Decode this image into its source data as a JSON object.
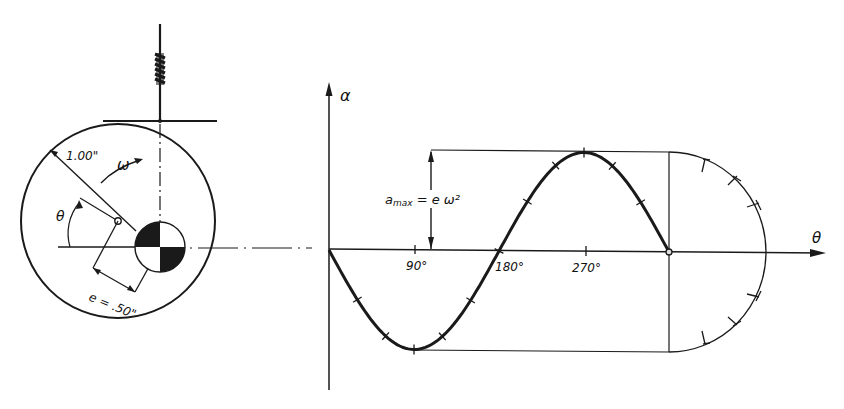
{
  "colors": {
    "ink": "#1a1a1a",
    "background": "#ffffff"
  },
  "cam_figure": {
    "radius_label": "1.00\"",
    "omega_label": "ω",
    "theta_label": "θ",
    "eccentricity_label": "e = .50\""
  },
  "graph": {
    "y_axis_label": "α",
    "x_axis_label": "θ",
    "amax_label": "a",
    "amax_sub": "max",
    "amax_eq": " = e ω²",
    "ticks": [
      "90°",
      "180°",
      "270°"
    ]
  },
  "chart_data": {
    "type": "line",
    "title": "",
    "xlabel": "θ",
    "ylabel": "α",
    "x": [
      0,
      30,
      60,
      90,
      120,
      150,
      180,
      210,
      240,
      270,
      300,
      330,
      360
    ],
    "series": [
      {
        "name": "α (normalized to a_max = e ω²)",
        "values": [
          0,
          -0.5,
          -0.866,
          -1,
          -0.866,
          -0.5,
          0,
          0.5,
          0.866,
          1,
          0.866,
          0.5,
          0
        ]
      }
    ],
    "x_tick_labels": [
      "90°",
      "180°",
      "270°"
    ],
    "annotations": [
      "a_max = e ω²"
    ],
    "ylim": [
      -1,
      1
    ],
    "xlim": [
      0,
      360
    ],
    "grid": false,
    "legend": "none"
  }
}
